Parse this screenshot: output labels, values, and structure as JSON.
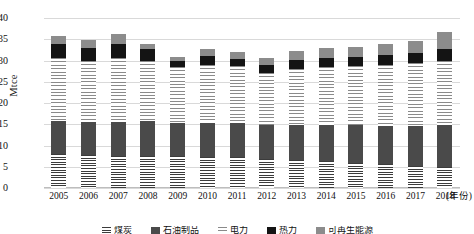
{
  "chart_data": {
    "type": "bar",
    "stacked": true,
    "title": "",
    "xlabel": "(年份)",
    "ylabel": "Mtce",
    "ylim": [
      0,
      40
    ],
    "ytick_step": 5,
    "yticks": [
      "40",
      "35",
      "30",
      "25",
      "20",
      "15",
      "10",
      "5",
      "0"
    ],
    "grid": true,
    "legend_position": "bottom",
    "categories": [
      "2005",
      "2006",
      "2007",
      "2008",
      "2009",
      "2010",
      "2011",
      "2012",
      "2013",
      "2014",
      "2015",
      "2016",
      "2017",
      "2018"
    ],
    "series": [
      {
        "name": "煤炭",
        "pattern": "dense-horizontal-hatch",
        "color": "#3b3b3b",
        "values": [
          7.9,
          7.7,
          7.6,
          7.6,
          7.5,
          7.4,
          7.2,
          6.9,
          6.6,
          6.3,
          6.0,
          5.6,
          5.2,
          4.9
        ]
      },
      {
        "name": "石油制品",
        "pattern": "solid-dark-gray",
        "color": "#4a4a4a",
        "values": [
          7.8,
          7.8,
          8.0,
          8.1,
          7.8,
          7.9,
          8.1,
          8.0,
          8.3,
          8.6,
          8.8,
          9.1,
          9.5,
          9.9
        ]
      },
      {
        "name": "电力",
        "pattern": "light-horizontal-hatch",
        "color": "#8a8a8a",
        "values": [
          14.8,
          14.3,
          14.9,
          14.1,
          13.2,
          13.6,
          13.4,
          12.2,
          13.1,
          13.5,
          13.8,
          14.2,
          14.6,
          15.1
        ]
      },
      {
        "name": "热力",
        "pattern": "solid-black",
        "color": "#141414",
        "values": [
          3.3,
          3.2,
          3.5,
          2.8,
          1.4,
          2.2,
          1.7,
          1.9,
          2.1,
          2.2,
          2.3,
          2.3,
          2.4,
          2.9
        ]
      },
      {
        "name": "可再生能源",
        "pattern": "solid-medium-gray",
        "color": "#8c8c8c",
        "values": [
          2.0,
          1.9,
          2.2,
          1.3,
          1.0,
          1.7,
          1.5,
          1.6,
          2.1,
          2.3,
          2.4,
          2.6,
          2.8,
          4.0
        ]
      }
    ],
    "totals": [
      35.8,
      34.9,
      36.2,
      33.9,
      30.9,
      32.8,
      31.9,
      30.6,
      32.2,
      32.9,
      33.3,
      33.8,
      34.5,
      36.8
    ]
  }
}
